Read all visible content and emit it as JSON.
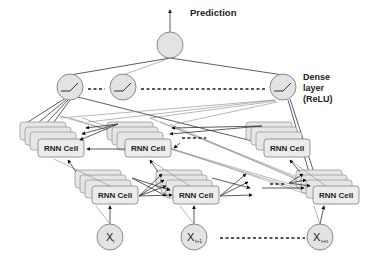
{
  "diagram": {
    "output_label": "Prediction",
    "dense_label_lines": [
      "Dense",
      "layer",
      "(ReLU)"
    ],
    "cell_label": "RNN Cell",
    "inputs": [
      {
        "symbol": "X",
        "subscript": "t"
      },
      {
        "symbol": "X",
        "subscript": "t+1"
      },
      {
        "symbol": "X",
        "subscript": "t+n"
      }
    ],
    "dense_neurons": 3,
    "activation_glyph": "relu-curve",
    "colors": {
      "node_fill": "#e3e3e3",
      "node_stroke": "#8a8a8a",
      "cell_fill": "#ececec",
      "edge": "#333333",
      "text": "#222222"
    }
  }
}
